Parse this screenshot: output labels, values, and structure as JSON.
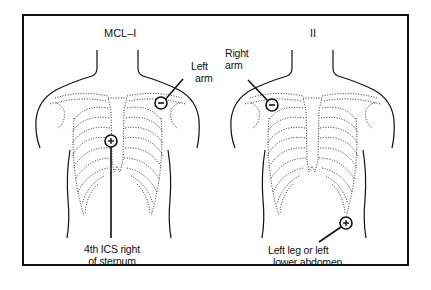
{
  "diagram": {
    "type": "ECG lead placement",
    "panels": [
      {
        "id": "mcl1",
        "title": "MCL–I",
        "electrodes": [
          {
            "polarity": "negative",
            "symbol": "−",
            "label_lines": [
              "Left",
              "arm"
            ]
          },
          {
            "polarity": "positive",
            "symbol": "+",
            "label_lines": [
              "4th ICS right",
              "of sternum"
            ]
          }
        ]
      },
      {
        "id": "lead2",
        "title": "II",
        "electrodes": [
          {
            "polarity": "negative",
            "symbol": "−",
            "label_lines": [
              "Right",
              "arm"
            ]
          },
          {
            "polarity": "positive",
            "symbol": "+",
            "label_lines": [
              "Left leg or left",
              "lower abdomen"
            ]
          }
        ]
      }
    ]
  },
  "colors": {
    "ink": "#111111",
    "background": "#ffffff"
  }
}
